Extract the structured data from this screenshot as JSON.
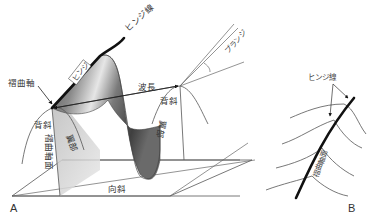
{
  "figure": {
    "panels": [
      {
        "id": "A",
        "label": "A",
        "labels": {
          "hinge_line": "ヒンジ線",
          "hinge": "ヒンジ",
          "fold_axis": "褶曲軸",
          "wavelength": "波長",
          "anticline_left": "背斜",
          "anticline_right": "背斜",
          "axial_plane": "褶曲軸面",
          "limb_left": "翼部",
          "limb_right": "翼部",
          "syncline": "向斜",
          "plunge": "プランジ"
        }
      },
      {
        "id": "B",
        "label": "B",
        "labels": {
          "hinge_line": "ヒンジ線",
          "axial_plane": "褶曲軸面"
        }
      }
    ],
    "colors": {
      "line": "#555555",
      "hinge": "#111111",
      "surface_dark": "#4a4a4a",
      "surface_light": "#e8e8e8",
      "plane_shade": "#c8c8c8",
      "text": "#333333"
    }
  }
}
